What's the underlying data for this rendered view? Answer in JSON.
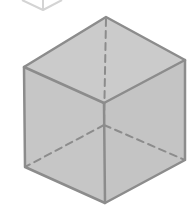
{
  "figure": {
    "colors": {
      "background": "#ffffff",
      "cube_fill": "#c8c8c8",
      "cube_edge": "#8c8c8c",
      "hidden_edge": "#8c8c8c",
      "partial_cube_edge": "#d4d4d4"
    },
    "partial_cube": {
      "label": "partial wireframe cube (cut off at top)",
      "points": "22,0 43,10 62,0"
    },
    "cube": {
      "vertices": {
        "top": [
          106,
          17
        ],
        "top_left": [
          24,
          67
        ],
        "top_right": [
          185,
          60
        ],
        "front": [
          104,
          103
        ],
        "bottom_left": [
          25,
          167
        ],
        "bottom_right": [
          185,
          160
        ],
        "bottom": [
          105,
          203
        ],
        "hidden_back": [
          104,
          125
        ]
      },
      "visible_edges": 9,
      "hidden_edges": 3
    }
  }
}
